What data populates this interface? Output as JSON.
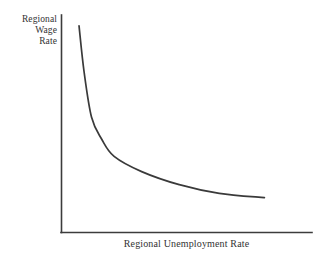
{
  "chart_data": {
    "type": "line",
    "title": "",
    "subtitle": "",
    "xlabel": "Regional Unemployment Rate",
    "ylabel": "Regional Wage Rate",
    "ylabel_lines": [
      "Regional",
      "Wage",
      "Rate"
    ],
    "grid": false,
    "legend": "none",
    "annotations": [],
    "xlim": [
      0,
      10
    ],
    "ylim": [
      0,
      10
    ],
    "xticks": [],
    "yticks": [],
    "xticklabels": [],
    "yticklabels": [],
    "series": [
      {
        "name": "Wage curve",
        "color": "#3a3a3a",
        "x": [
          0.7,
          0.9,
          1.2,
          1.6,
          2.1,
          3.2,
          4.7,
          6.3,
          8.1
        ],
        "y": [
          9.5,
          7.4,
          5.3,
          4.3,
          3.5,
          2.8,
          2.2,
          1.8,
          1.6
        ]
      }
    ]
  },
  "figure": {
    "background_color": "#ffffff",
    "axis_color": "#3c3c3c",
    "curve_color": "#3a3a3a",
    "text_color": "#333333"
  }
}
